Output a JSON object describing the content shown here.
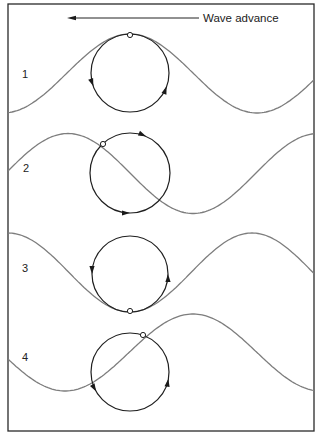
{
  "figure": {
    "title": "Wave advance",
    "direction_arrow": {
      "x1": 199,
      "x2": 67,
      "y": 18,
      "label": "Wave advance",
      "label_x": 203,
      "label_y": 22
    },
    "frame": {
      "x": 8,
      "y": 4,
      "width": 306,
      "height": 427
    },
    "colors": {
      "wave": "#7d7d7d",
      "orbit": "#1f1f1f",
      "frame": "#2a2a2a"
    },
    "panels": [
      {
        "label": "1",
        "label_x": 22,
        "label_y": 78,
        "wave": {
          "crest_x": 130,
          "mean_y": 73.5,
          "amplitude": 39.5,
          "wavelength": 254
        },
        "orbit": {
          "cx": 130,
          "cy": 73,
          "r": 39
        },
        "particle": {
          "x": 130,
          "y": 35
        },
        "arrows": [
          {
            "angle_deg": 200,
            "dir": "down"
          },
          {
            "angle_deg": -20,
            "dir": "up"
          }
        ]
      },
      {
        "label": "2",
        "label_x": 23,
        "label_y": 172,
        "wave": {
          "crest_x": 68,
          "mean_y": 173.5,
          "amplitude": 40,
          "wavelength": 250
        },
        "orbit": {
          "cx": 130,
          "cy": 173,
          "r": 40
        },
        "particle": {
          "x": 103,
          "y": 144
        },
        "arrows": [
          {
            "angle_deg": 66,
            "dir": "cw"
          },
          {
            "angle_deg": 270,
            "dir": "cw_bottom"
          }
        ]
      },
      {
        "label": "3",
        "label_x": 22,
        "label_y": 272,
        "wave": {
          "crest_x": 8,
          "mean_y": 272.5,
          "amplitude": 39.5,
          "wavelength": 244
        },
        "orbit": {
          "cx": 130,
          "cy": 274,
          "r": 38
        },
        "particle": {
          "x": 130,
          "y": 311
        },
        "arrows": [
          {
            "angle_deg": 180,
            "dir": "down"
          },
          {
            "angle_deg": 0,
            "dir": "up"
          }
        ]
      },
      {
        "label": "4",
        "label_x": 22,
        "label_y": 361,
        "wave": {
          "crest_x": 193,
          "mean_y": 352.5,
          "amplitude": 38.5,
          "wavelength": 256
        },
        "orbit": {
          "cx": 130,
          "cy": 372,
          "r": 39
        },
        "particle": {
          "x": 143,
          "y": 335
        },
        "arrows": [
          {
            "angle_deg": 210,
            "dir": "down"
          },
          {
            "angle_deg": -10,
            "dir": "up"
          }
        ]
      }
    ]
  }
}
